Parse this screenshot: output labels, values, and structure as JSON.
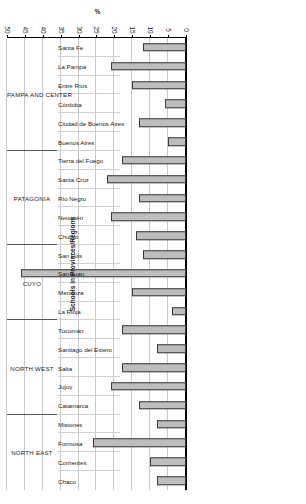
{
  "chart_data": {
    "type": "bar",
    "orientation": "horizontal",
    "title": "",
    "xlabel": "%",
    "ylabel": "Schools in Provinces/Regions",
    "xlim": [
      0,
      50
    ],
    "xticks": [
      0,
      5,
      10,
      15,
      20,
      25,
      30,
      35,
      40,
      45,
      50
    ],
    "grid": true,
    "legend": null,
    "bar_color": "#bdbdbd",
    "bar_edge_color": "#3a3a3a",
    "categories": [
      "Chaco",
      "Corrientes",
      "Formosa",
      "Misiones",
      "Catamarca",
      "Jujuy",
      "Salta",
      "Santiago del Estero",
      "Tucumán",
      "La Rioja",
      "Mendoza",
      "San Juan",
      "San Luis",
      "Chubut",
      "Neuquén",
      "Río Negro",
      "Santa Cruz",
      "Tierra del Fuego",
      "Buenos Aires",
      "Ciudad de Buenos Aires",
      "Córdoba",
      "Entre Ríos",
      "La Pampa",
      "Santa Fe"
    ],
    "values": [
      8,
      10,
      26,
      8,
      13,
      21,
      18,
      8,
      18,
      4,
      15,
      46,
      12,
      14,
      21,
      13,
      22,
      18,
      5,
      13,
      6,
      15,
      21,
      12
    ],
    "groups": [
      {
        "label": "NORTH EAST",
        "count": 4
      },
      {
        "label": "NORTH WEST",
        "count": 5
      },
      {
        "label": "CUYO",
        "count": 4
      },
      {
        "label": "PATAGONIA",
        "count": 5
      },
      {
        "label": "PAMPA AND CENTER",
        "count": 6
      }
    ]
  }
}
